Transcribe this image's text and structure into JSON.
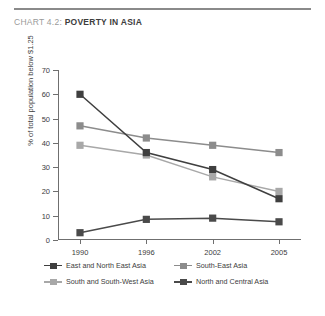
{
  "header": {
    "chart_label": "CHART 4.2:",
    "chart_name": "POVERTY IN ASIA"
  },
  "chart_data": {
    "type": "line",
    "title": "CHART 4.2: POVERTY IN ASIA",
    "xlabel": "",
    "ylabel": "% of total population below $1.25",
    "categories": [
      "1990",
      "1996",
      "2002",
      "2005"
    ],
    "ylim": [
      0,
      70
    ],
    "yticks": [
      0,
      10,
      20,
      30,
      40,
      50,
      60,
      70
    ],
    "grid": false,
    "legend_position": "bottom",
    "series": [
      {
        "name": "East and North East Asia",
        "color": "#3f3f3f",
        "values": [
          60,
          36,
          29,
          17
        ]
      },
      {
        "name": "South-East Asia",
        "color": "#8c8c8c",
        "values": [
          47,
          42,
          39,
          36
        ]
      },
      {
        "name": "South and South-West Asia",
        "color": "#a8a8a8",
        "values": [
          39,
          35,
          26,
          20
        ]
      },
      {
        "name": "North and Central Asia",
        "color": "#4a4a4a",
        "values": [
          3,
          8.5,
          9,
          7.5
        ]
      }
    ]
  },
  "legend": {
    "items": [
      "East and North East Asia",
      "South-East Asia",
      "South and South-West Asia",
      "North and Central Asia"
    ]
  },
  "axis": {
    "y_labels": [
      "70",
      "60",
      "50",
      "40",
      "30",
      "20",
      "10",
      "0"
    ],
    "x_labels": [
      "1990",
      "1996",
      "2002",
      "2005"
    ]
  },
  "colors": {
    "rule": "#8a8a8a",
    "title_label": "#9a9a9a",
    "title_name": "#3d3d3d",
    "axis": "#6f6f6f"
  }
}
